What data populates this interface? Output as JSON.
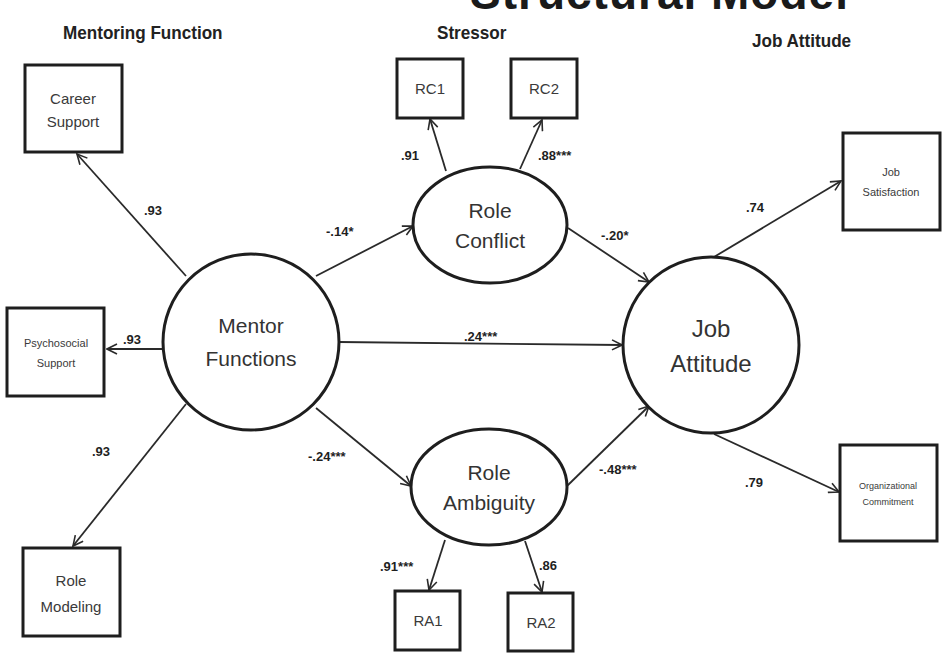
{
  "title": "Structural Model",
  "sections": {
    "mentoring": "Mentoring Function",
    "stressor": "Stressor",
    "job_attitude": "Job Attitude"
  },
  "colors": {
    "stroke": "#1e1e1e",
    "text": "#333333",
    "background": "#ffffff"
  },
  "indicators": {
    "career_support": {
      "line1": "Career",
      "line2": "Support"
    },
    "psychosocial_support": {
      "line1": "Psychosocial",
      "line2": "Support"
    },
    "role_modeling": {
      "line1": "Role",
      "line2": "Modeling"
    },
    "rc1": {
      "label": "RC1"
    },
    "rc2": {
      "label": "RC2"
    },
    "ra1": {
      "label": "RA1"
    },
    "ra2": {
      "label": "RA2"
    },
    "job_satisfaction": {
      "line1": "Job",
      "line2": "Satisfaction"
    },
    "organizational_commitment": {
      "line1": "Organizational",
      "line2": "Commitment"
    }
  },
  "latents": {
    "mentor_functions": {
      "line1": "Mentor",
      "line2": "Functions"
    },
    "role_conflict": {
      "line1": "Role",
      "line2": "Conflict"
    },
    "role_ambiguity": {
      "line1": "Role",
      "line2": "Ambiguity"
    },
    "job_attitude": {
      "line1": "Job",
      "line2": "Attitude"
    }
  },
  "coefficients": {
    "mf_career": ".93",
    "mf_psychosocial": ".93",
    "mf_modeling": ".93",
    "rc_rc1": ".91",
    "rc_rc2": ".88***",
    "ra_ra1": ".91***",
    "ra_ra2": ".86",
    "mf_rc": "-.14*",
    "mf_ra": "-.24***",
    "mf_ja": ".24***",
    "rc_ja": "-.20*",
    "ra_ja": "-.48***",
    "ja_satisfaction": ".74",
    "ja_commitment": ".79"
  }
}
